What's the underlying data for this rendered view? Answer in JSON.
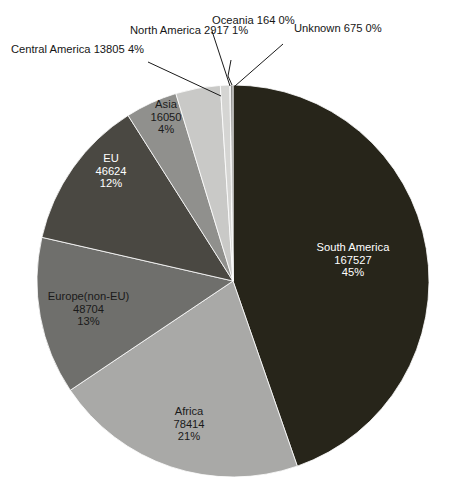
{
  "chart_data": {
    "type": "pie",
    "title": "",
    "subtitle": "",
    "xlabel": "",
    "ylabel": "",
    "legend_position": "none",
    "grid": false,
    "total": 374980,
    "label_format": "name / value / percent",
    "categories": [
      "South America",
      "Africa",
      "Europe(non-EU)",
      "EU",
      "Asia",
      "Central America",
      "North America",
      "Oceania",
      "Unknown"
    ],
    "values": [
      167527,
      78414,
      48704,
      46624,
      16050,
      13805,
      2917,
      164,
      675
    ],
    "percents": [
      "45%",
      "21%",
      "13%",
      "12%",
      "4%",
      "4%",
      "1%",
      "0%",
      "0%"
    ],
    "colors": [
      "#27251a",
      "#a9a9a7",
      "#6f6f6c",
      "#4a4842",
      "#90908d",
      "#c9c9c7",
      "#d5d5d3",
      "#b4b4b2",
      "#8d8d8b"
    ],
    "slices": [
      {
        "name": "South America",
        "value": "167527",
        "percent": "45%",
        "color": "#27251a",
        "start_deg": 0.0,
        "end_deg": 160.85,
        "label_placement": "inside",
        "label_dark_bg": true
      },
      {
        "name": "Africa",
        "value": "78414",
        "percent": "21%",
        "color": "#a9a9a7",
        "start_deg": 160.85,
        "end_deg": 236.12,
        "label_placement": "inside",
        "label_dark_bg": false
      },
      {
        "name": "Europe(non-EU)",
        "value": "48704",
        "percent": "13%",
        "color": "#6f6f6c",
        "start_deg": 236.12,
        "end_deg": 282.87,
        "label_placement": "inside",
        "label_dark_bg": false
      },
      {
        "name": "EU",
        "value": "46624",
        "percent": "12%",
        "color": "#4a4842",
        "start_deg": 282.87,
        "end_deg": 327.63,
        "label_placement": "inside",
        "label_dark_bg": true
      },
      {
        "name": "Asia",
        "value": "16050",
        "percent": "4%",
        "color": "#90908d",
        "start_deg": 327.63,
        "end_deg": 343.04,
        "label_placement": "inside",
        "label_dark_bg": false
      },
      {
        "name": "Central America",
        "value": "13805",
        "percent": "4%",
        "color": "#c9c9c7",
        "start_deg": 343.04,
        "end_deg": 356.29,
        "label_placement": "outside",
        "label_dark_bg": false
      },
      {
        "name": "North America",
        "value": "2917",
        "percent": "1%",
        "color": "#d5d5d3",
        "start_deg": 356.29,
        "end_deg": 359.09,
        "label_placement": "outside",
        "label_dark_bg": false
      },
      {
        "name": "Oceania",
        "value": "164",
        "percent": "0%",
        "color": "#b4b4b2",
        "start_deg": 359.09,
        "end_deg": 359.25,
        "label_placement": "outside",
        "label_dark_bg": false
      },
      {
        "name": "Unknown",
        "value": "675",
        "percent": "0%",
        "color": "#8d8d8b",
        "start_deg": 359.25,
        "end_deg": 360.0,
        "label_placement": "outside",
        "label_dark_bg": false
      }
    ]
  },
  "geometry": {
    "center_x": 233,
    "center_y": 281,
    "radius": 196
  }
}
